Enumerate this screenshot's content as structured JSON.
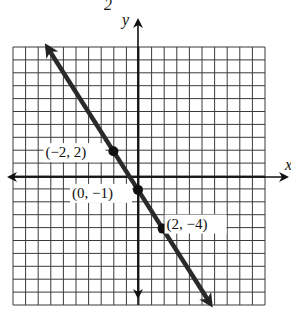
{
  "header": {
    "fragment": "2"
  },
  "chart_data": {
    "type": "line",
    "title": "",
    "xlabel": "x",
    "ylabel": "y",
    "xlim": [
      -10,
      10
    ],
    "ylim": [
      -10,
      10
    ],
    "grid": true,
    "grid_step": 1,
    "equation": "y = -3/2 x - 1",
    "series": [
      {
        "name": "line",
        "points": [
          {
            "x": -2,
            "y": 2,
            "label": "(−2, 2)"
          },
          {
            "x": 0,
            "y": -1,
            "label": "(0, −1)"
          },
          {
            "x": 2,
            "y": -4,
            "label": "(2, −4)"
          }
        ]
      }
    ],
    "colors": {
      "line": "#2a2a2a",
      "grid": "#333333",
      "background": "#ffffff"
    }
  }
}
